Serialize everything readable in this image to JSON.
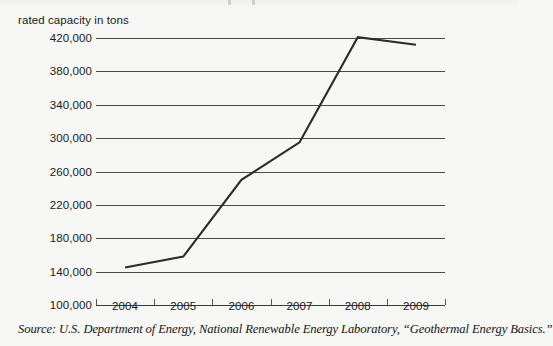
{
  "chart_data": {
    "type": "line",
    "title": "",
    "xlabel": "",
    "ylabel": "rated capacity in tons",
    "categories": [
      "2004",
      "2005",
      "2006",
      "2007",
      "2008",
      "2009"
    ],
    "values": [
      145000,
      158000,
      250000,
      295000,
      421000,
      412000
    ],
    "series": [
      {
        "name": "rated capacity in tons",
        "values": [
          145000,
          158000,
          250000,
          295000,
          421000,
          412000
        ]
      }
    ],
    "ylim": [
      100000,
      420000
    ],
    "ytick_labels": [
      "420,000",
      "380,000",
      "340,000",
      "300,000",
      "260,000",
      "220,000",
      "180,000",
      "140,000",
      "100,000"
    ],
    "ytick_values": [
      420000,
      380000,
      340000,
      300000,
      260000,
      220000,
      180000,
      140000,
      100000
    ],
    "grid": true,
    "legend": false,
    "legend_position": "none",
    "line_color": "#2b2b2b",
    "grid_color": "#4a4a4a",
    "background_color": "#f7f7f6"
  },
  "axis": {
    "y_title": "rated capacity in tons"
  },
  "source": {
    "note": "Source: U.S. Department of Energy, National Renewable Energy Laboratory, “Geothermal Energy Basics.”"
  }
}
